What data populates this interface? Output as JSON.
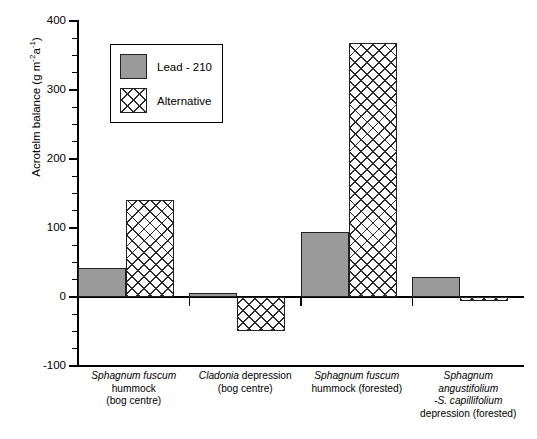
{
  "chart_data": {
    "type": "bar",
    "title": "",
    "xlabel": "",
    "ylabel": "Acrotelm balance (g m-2a-1)",
    "ylabel_parts": {
      "main": "Acrotelm balance (g m",
      "sup1": "-2",
      "mid": "a",
      "sup2": "-1",
      "close": ")"
    },
    "ylim": [
      -100,
      400
    ],
    "ytick_labels": [
      "400",
      "300",
      "200",
      "100",
      "0",
      "-100"
    ],
    "ytick_values": [
      400,
      300,
      200,
      100,
      0,
      -100
    ],
    "yminor_step": 25,
    "grid": false,
    "legend_position": "inside-upper-left",
    "categories": [
      "Sphagnum fuscum hummock (bog centre)",
      "Cladonia depression (bog centre)",
      "Sphagnum fuscum hummock (forested)",
      "Sphagnum angustifolium -S. capillifolium depression (forested)"
    ],
    "category_label_lines": [
      [
        {
          "text": "Sphagnum fuscum",
          "italic": true
        },
        {
          "text": "hummock",
          "italic": false
        },
        {
          "text": "(bog centre)",
          "italic": false
        }
      ],
      [
        {
          "text": "Cladonia depression",
          "italic": "partial",
          "italic_prefix": "Cladonia",
          "rest": " depression"
        },
        {
          "text": "(bog centre)",
          "italic": false
        }
      ],
      [
        {
          "text": "Sphagnum fuscum",
          "italic": true
        },
        {
          "text": "hummock (forested)",
          "italic": false
        }
      ],
      [
        {
          "text": "Sphagnum",
          "italic": true
        },
        {
          "text": "angustifolium",
          "italic": true
        },
        {
          "text": "-S. capillifolium",
          "italic": true
        },
        {
          "text": "depression (forested)",
          "italic": false
        }
      ]
    ],
    "series": [
      {
        "name": "Lead - 210",
        "style": "solid-gray",
        "color": "#9a9a9a",
        "values": [
          42,
          6,
          94,
          29
        ]
      },
      {
        "name": "Alternative",
        "style": "cross-hatch",
        "color": "#ffffff",
        "values": [
          140,
          -49,
          368,
          -6
        ]
      }
    ]
  },
  "legend": {
    "items": [
      {
        "label": "Lead - 210",
        "swatch": "solid-gray"
      },
      {
        "label": "Alternative",
        "swatch": "cross-hatch"
      }
    ]
  }
}
